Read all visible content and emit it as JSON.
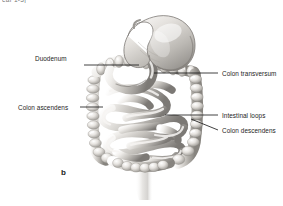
{
  "figure": {
    "panel_letter": "b",
    "cropped_header_text": "ear 1-3]",
    "style": "grayscale-anatomical-illustration",
    "background_color": "#ffffff",
    "line_color": "#1a1a1a",
    "tissue_light": "#f2f0ee",
    "tissue_mid": "#c9c6c2",
    "tissue_dark": "#8f8c88",
    "tissue_shadow": "#6d6a66"
  },
  "labels": [
    {
      "id": "duodenum",
      "text": "Duodenum",
      "side": "left",
      "text_x": 35,
      "text_y": 62,
      "leader": {
        "x1": 84,
        "y1": 65,
        "x2": 139,
        "y2": 65
      }
    },
    {
      "id": "colon-transversum",
      "text": "Colon transversum",
      "side": "right",
      "text_x": 222,
      "text_y": 70,
      "leader": {
        "x1": 218,
        "y1": 73,
        "x2": 154,
        "y2": 73
      }
    },
    {
      "id": "colon-ascendens",
      "text": "Colon ascendens",
      "side": "left",
      "text_x": 18,
      "text_y": 104,
      "leader": {
        "x1": 80,
        "y1": 107,
        "x2": 103,
        "y2": 107
      }
    },
    {
      "id": "intestinal-loops",
      "text": "Intestinal loops",
      "side": "right",
      "text_x": 222,
      "text_y": 112,
      "leader": {
        "x1": 218,
        "y1": 115,
        "x2": 165,
        "y2": 115
      }
    },
    {
      "id": "colon-descendens",
      "text": "Colon descendens",
      "side": "right",
      "text_x": 222,
      "text_y": 127,
      "leader": {
        "x1": 218,
        "y1": 130,
        "x2": 191,
        "y2": 119
      }
    }
  ],
  "anatomy_parts": [
    {
      "name": "stomach",
      "note": "J-shaped, upper right of figure"
    },
    {
      "name": "duodenum",
      "note": "C-loop below stomach pylorus"
    },
    {
      "name": "colon-transversum",
      "note": "haustrated horizontal band under stomach"
    },
    {
      "name": "colon-ascendens",
      "note": "haustrated vertical band on left"
    },
    {
      "name": "colon-descendens",
      "note": "haustrated vertical band on right"
    },
    {
      "name": "intestinal-loops",
      "note": "coiled jejunum and ileum filling center"
    },
    {
      "name": "cecum",
      "note": "rounded pouch lower left"
    },
    {
      "name": "rectum",
      "note": "faint descending segment bottom center"
    }
  ]
}
